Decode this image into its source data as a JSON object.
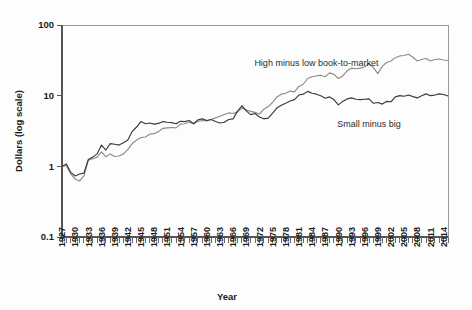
{
  "chart_data": {
    "type": "line",
    "title": "",
    "xlabel": "Year",
    "ylabel": "Dollars (log scale)",
    "log_y": true,
    "ylim": [
      0.1,
      100
    ],
    "xlim": [
      1927,
      2015
    ],
    "grid": false,
    "legend_position": "inline-annotations",
    "y_ticks": [
      "100",
      "10",
      "1",
      "0.1"
    ],
    "y_tick_values": [
      100,
      10,
      1,
      0.1
    ],
    "x_ticks": [
      "1927",
      "1930",
      "1933",
      "1936",
      "1939",
      "1942",
      "1945",
      "1948",
      "1951",
      "1954",
      "1957",
      "1960",
      "1963",
      "1966",
      "1969",
      "1972",
      "1975",
      "1978",
      "1981",
      "1984",
      "1987",
      "1990",
      "1993",
      "1996",
      "1999",
      "2002",
      "2005",
      "2008",
      "2011",
      "2014"
    ],
    "x_minor_tick_interval": 1,
    "annotations": [
      {
        "text": "High minus low book-to-market",
        "x": 1985,
        "y": 26.0
      },
      {
        "text": "Small minus big",
        "x": 1997,
        "y": 3.6
      }
    ],
    "series": [
      {
        "name": "High minus low book-to-market",
        "color": "#8c8c8c",
        "x": [
          1927,
          1928,
          1929,
          1930,
          1931,
          1932,
          1933,
          1934,
          1935,
          1936,
          1937,
          1938,
          1939,
          1940,
          1941,
          1942,
          1943,
          1944,
          1945,
          1946,
          1947,
          1948,
          1949,
          1950,
          1951,
          1952,
          1953,
          1954,
          1955,
          1956,
          1957,
          1958,
          1959,
          1960,
          1961,
          1962,
          1963,
          1964,
          1965,
          1966,
          1967,
          1968,
          1969,
          1970,
          1971,
          1972,
          1973,
          1974,
          1975,
          1976,
          1977,
          1978,
          1979,
          1980,
          1981,
          1982,
          1983,
          1984,
          1985,
          1986,
          1987,
          1988,
          1989,
          1990,
          1991,
          1992,
          1993,
          1994,
          1995,
          1996,
          1997,
          1998,
          1999,
          2000,
          2001,
          2002,
          2003,
          2004,
          2005,
          2006,
          2007,
          2008,
          2009,
          2010,
          2011,
          2012,
          2013,
          2014,
          2015
        ],
        "values": [
          1.0,
          1.02,
          0.78,
          0.66,
          0.62,
          0.73,
          1.22,
          1.28,
          1.35,
          1.6,
          1.36,
          1.5,
          1.38,
          1.4,
          1.5,
          1.72,
          2.1,
          2.35,
          2.55,
          2.6,
          2.85,
          2.9,
          3.1,
          3.45,
          3.5,
          3.55,
          3.5,
          3.95,
          4.0,
          4.2,
          4.0,
          4.35,
          4.45,
          4.4,
          4.6,
          4.85,
          5.1,
          5.4,
          5.7,
          5.6,
          5.9,
          6.7,
          6.3,
          6.0,
          5.8,
          5.5,
          6.4,
          7.0,
          8.0,
          9.6,
          10.5,
          10.8,
          11.6,
          11.3,
          13.5,
          14.5,
          17.5,
          18.5,
          19.0,
          19.5,
          18.5,
          21.0,
          20.0,
          17.5,
          19.0,
          22.5,
          24.5,
          24.0,
          24.5,
          25.5,
          28.5,
          25.0,
          20.5,
          26.0,
          29.5,
          31.0,
          34.5,
          36.5,
          37.0,
          38.5,
          35.0,
          31.0,
          32.5,
          33.5,
          31.0,
          32.5,
          33.0,
          32.0,
          31.5
        ]
      },
      {
        "name": "Small minus big",
        "color": "#3a3a3a",
        "x": [
          1927,
          1928,
          1929,
          1930,
          1931,
          1932,
          1933,
          1934,
          1935,
          1936,
          1937,
          1938,
          1939,
          1940,
          1941,
          1942,
          1943,
          1944,
          1945,
          1946,
          1947,
          1948,
          1949,
          1950,
          1951,
          1952,
          1953,
          1954,
          1955,
          1956,
          1957,
          1958,
          1959,
          1960,
          1961,
          1962,
          1963,
          1964,
          1965,
          1966,
          1967,
          1968,
          1969,
          1970,
          1971,
          1972,
          1973,
          1974,
          1975,
          1976,
          1977,
          1978,
          1979,
          1980,
          1981,
          1982,
          1983,
          1984,
          1985,
          1986,
          1987,
          1988,
          1989,
          1990,
          1991,
          1992,
          1993,
          1994,
          1995,
          1996,
          1997,
          1998,
          1999,
          2000,
          2001,
          2002,
          2003,
          2004,
          2005,
          2006,
          2007,
          2008,
          2009,
          2010,
          2011,
          2012,
          2013,
          2014,
          2015
        ],
        "values": [
          1.0,
          1.08,
          0.82,
          0.73,
          0.78,
          0.8,
          1.25,
          1.35,
          1.5,
          2.0,
          1.7,
          2.1,
          2.05,
          2.0,
          2.15,
          2.35,
          3.1,
          3.6,
          4.3,
          4.0,
          4.1,
          3.95,
          4.05,
          4.3,
          4.2,
          4.15,
          4.0,
          4.35,
          4.3,
          4.45,
          4.0,
          4.55,
          4.7,
          4.45,
          4.6,
          4.3,
          4.1,
          4.2,
          4.6,
          4.7,
          6.0,
          7.2,
          6.1,
          5.4,
          5.6,
          5.0,
          4.7,
          4.8,
          5.6,
          6.7,
          7.3,
          7.8,
          8.4,
          8.8,
          10.2,
          10.5,
          11.5,
          10.8,
          10.5,
          10.0,
          9.2,
          9.6,
          8.8,
          7.4,
          8.3,
          9.0,
          9.3,
          8.9,
          8.8,
          8.9,
          9.0,
          7.8,
          8.0,
          7.6,
          8.3,
          8.2,
          9.6,
          10.0,
          9.8,
          10.2,
          9.7,
          9.3,
          10.0,
          10.6,
          10.0,
          10.2,
          10.6,
          10.4,
          9.9
        ]
      }
    ]
  }
}
